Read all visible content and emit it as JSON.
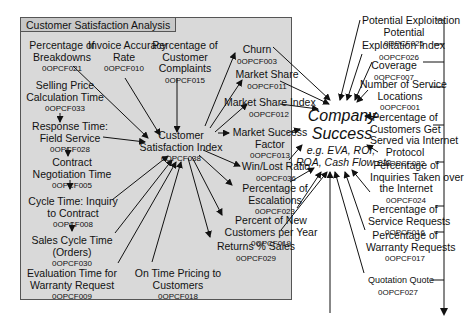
{
  "panel": {
    "title": "Customer Satisfaction Analysis",
    "bg": "#d9d9d9"
  },
  "center": {
    "label": "Customer\nSatisfaction Index",
    "code": "0OPCF038"
  },
  "target": {
    "title": "Company\nSuccess",
    "subtitle": "e.g. EVA, ROI,\nROA, Cash Flow etc"
  },
  "left_nodes": [
    {
      "label": "Percentage of\nBreakdowns",
      "code": "0OPCF021"
    },
    {
      "label": "Invoice Accuracy\nRate",
      "code": "0OPCF010"
    },
    {
      "label": "Percentage of\nCustomer\nComplaints",
      "code": "0OPCF015"
    },
    {
      "label": "Selling Price\nCalculation Time",
      "code": "0OPCF033"
    },
    {
      "label": "Response Time:\nField Service",
      "code": "0OPCF028"
    },
    {
      "label": "Contract\nNegotiation Time",
      "code": "0OPCF005"
    },
    {
      "label": "Cycle Time: Inquiry\nto Contract",
      "code": "0OPCF008"
    },
    {
      "label": "Sales Cycle Time\n(Orders)",
      "code": "0OPCF030"
    },
    {
      "label": "Evaluation Time for\nWarranty Request",
      "code": "0OPCF009"
    },
    {
      "label": "On Time Pricing to\nCustomers",
      "code": "0OPCF018"
    }
  ],
  "mid_nodes": [
    {
      "label": "Churn",
      "code": "0OPCF003"
    },
    {
      "label": "Market Share",
      "code": "0OPCF011"
    },
    {
      "label": "Market Share Index",
      "code": "0OPCF012"
    },
    {
      "label": "Market Success\nFactor",
      "code": "0OPCF013"
    },
    {
      "label": "Win/Lost Ratio",
      "code": "0OPCF036"
    },
    {
      "label": "Percentage of\nEscalations",
      "code": "0OPCF023"
    },
    {
      "label": "Percent of New\nCustomers per Year",
      "code": "0OPCF019"
    },
    {
      "label": "Returns % Sales",
      "code": "0OPCF029"
    }
  ],
  "right_nodes": [
    {
      "label": "Potential Exploitation\nPotential",
      "code": "0OPCF025"
    },
    {
      "label": "Exploitation Index",
      "code": "0OPCF026"
    },
    {
      "label": "Coverage",
      "code": "0OPCF007"
    },
    {
      "label": "Number of Service\nLocations",
      "code": "0OPCF001"
    },
    {
      "label": "Percentage of\nCustomers Get\nServed via Internet\nProtocol",
      "code": "0OPCF022"
    },
    {
      "label": "Percentage of\nInquiries Taken over\nthe Internet",
      "code": "0OPCF024"
    },
    {
      "label": "Percentage of\nService Requests",
      "code": "0OPCF016"
    },
    {
      "label": "Percentage of\nWarranty Requests",
      "code": "0OPCF017"
    },
    {
      "label": "Quotation Quote",
      "code": "0OPCF027"
    }
  ]
}
